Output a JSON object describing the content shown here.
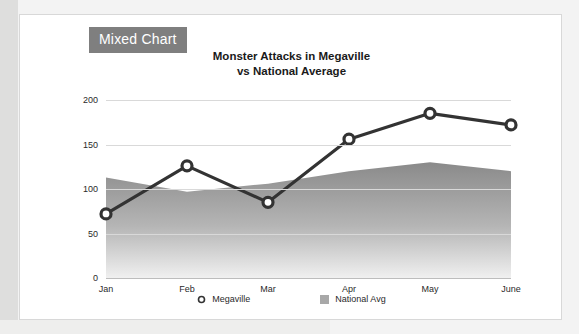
{
  "card": {
    "badge_label": "Mixed Chart"
  },
  "chart_data": {
    "type": "line",
    "title": "Monster Attacks in Megaville",
    "subtitle": "vs National Average",
    "title_line1": "Monster Attacks in Megaville",
    "title_line2": "vs National Average",
    "xlabel": "",
    "ylabel": "",
    "categories": [
      "Jan",
      "Feb",
      "Mar",
      "Apr",
      "May",
      "June"
    ],
    "yticks": [
      0,
      50,
      100,
      150,
      200
    ],
    "ylim": [
      0,
      200
    ],
    "grid": true,
    "legend_position": "bottom",
    "series": [
      {
        "name": "Megaville",
        "type": "line",
        "marker": "circle-open",
        "color": "#333333",
        "values": [
          72,
          126,
          85,
          156,
          185,
          172
        ]
      },
      {
        "name": "National Avg",
        "type": "area",
        "marker": "square",
        "color": "#a8a8a8",
        "values": [
          113,
          97,
          106,
          120,
          130,
          120
        ]
      }
    ]
  },
  "legend": [
    {
      "label": "Megaville",
      "marker": "circle-open-icon"
    },
    {
      "label": "National Avg",
      "marker": "square-swatch-icon"
    }
  ]
}
